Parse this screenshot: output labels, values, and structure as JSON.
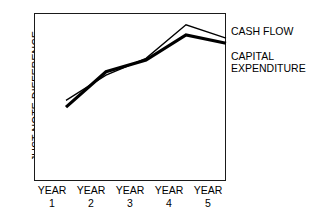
{
  "chart_data": {
    "type": "line",
    "title": "",
    "xlabel": "",
    "ylabel": "JUST NOTE DIFFERENCE",
    "categories": [
      "YEAR 1",
      "YEAR 2",
      "YEAR 3",
      "YEAR 4",
      "YEAR 5"
    ],
    "x_tick_names": [
      "YEAR",
      "YEAR",
      "YEAR",
      "YEAR",
      "YEAR"
    ],
    "x_tick_numbers": [
      "1",
      "2",
      "3",
      "4",
      "5"
    ],
    "grid": false,
    "axis_tick_marks": false,
    "y_axis_values_shown": false,
    "legend_position": "right",
    "series": [
      {
        "name": "CASH FLOW",
        "style": "thin",
        "color": "#000000",
        "line_width": 1.3,
        "values": [
          48,
          63,
          73,
          93,
          85
        ]
      },
      {
        "name": "CAPITAL EXPENDITURE",
        "style": "thick",
        "color": "#000000",
        "line_width": 3.2,
        "values": [
          44,
          65,
          72,
          87,
          82
        ]
      }
    ],
    "ylim": [
      0,
      100
    ],
    "xlim": [
      0,
      5
    ]
  },
  "axes": {
    "y_title": "JUST NOTE DIFFERENCE"
  },
  "legend": {
    "cash_flow": "CASH FLOW",
    "capital_expenditure_line1": "CAPITAL",
    "capital_expenditure_line2": "EXPENDITURE"
  },
  "colors": {
    "ink": "#000000",
    "frame": "#1a1a1a",
    "background": "#ffffff"
  }
}
